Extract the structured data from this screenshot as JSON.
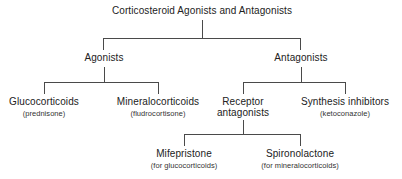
{
  "diagram": {
    "title": "Corticosteroid Agonists and Antagonists",
    "type": "hierarchy-tree",
    "line_color": "#4a4a4a",
    "background_color": "#ffffff",
    "text_color": "#222222",
    "nodes": {
      "root": {
        "label": "Corticosteroid Agonists and Antagonists",
        "sub": ""
      },
      "agonists": {
        "label": "Agonists",
        "sub": ""
      },
      "antagonists": {
        "label": "Antagonists",
        "sub": ""
      },
      "glucocorticoids": {
        "label": "Glucocorticoids",
        "sub": "(prednisone)"
      },
      "mineralocorticoids": {
        "label": "Mineralocorticoids",
        "sub": "(fludrocortisone)"
      },
      "receptor_antagonists": {
        "label_line1": "Receptor",
        "label_line2": "antagonists",
        "sub": ""
      },
      "synthesis_inhibitors": {
        "label": "Synthesis inhibitors",
        "sub": "(ketoconazole)"
      },
      "mifepristone": {
        "label": "Mifepristone",
        "sub": "(for glucocorticoids)"
      },
      "spironolactone": {
        "label": "Spironolactone",
        "sub": "(for mineralocorticoids)"
      }
    }
  }
}
